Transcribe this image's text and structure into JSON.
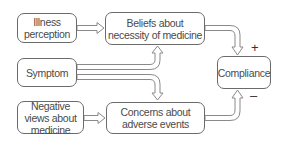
{
  "diagram": {
    "nodes": {
      "illness_perception": "Illness perception",
      "beliefs_necessity": "Beliefs about necessity of medicine",
      "symptom": "Symptom",
      "compliance": "Compliance",
      "negative_views": "Negative views about medicine",
      "concerns_adverse": "Concerns about adverse events"
    },
    "edges": [
      {
        "from": "illness_perception",
        "to": "beliefs_necessity"
      },
      {
        "from": "symptom",
        "to": "beliefs_necessity"
      },
      {
        "from": "symptom",
        "to": "concerns_adverse"
      },
      {
        "from": "negative_views",
        "to": "concerns_adverse"
      },
      {
        "from": "beliefs_necessity",
        "to": "compliance",
        "sign": "+"
      },
      {
        "from": "concerns_adverse",
        "to": "compliance",
        "sign": "–"
      }
    ],
    "signs": {
      "positive": "+",
      "negative": "–"
    },
    "colors": {
      "border": "#6b6b6b",
      "arrow_stroke": "#8a8a8a",
      "arrow_fill": "#ffffff",
      "text": "#4a4a4a"
    }
  }
}
